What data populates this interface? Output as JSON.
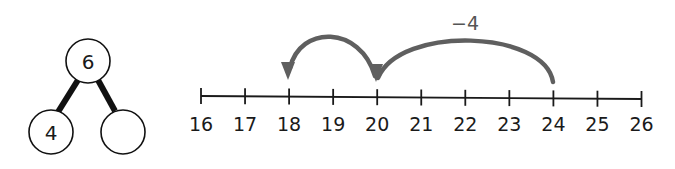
{
  "part_whole": {
    "whole": "6",
    "parts": [
      "4",
      ""
    ]
  },
  "number_line": {
    "ticks": [
      "16",
      "17",
      "18",
      "19",
      "20",
      "21",
      "22",
      "23",
      "24",
      "25",
      "26"
    ],
    "start_value": 24,
    "end_value": 18,
    "jumps": [
      {
        "from": 24,
        "to": 20
      },
      {
        "from": 20,
        "to": 18
      }
    ],
    "jump_label": "−4",
    "arrow_color": "#5f5f5f",
    "line_color": "#1a1a1a"
  }
}
